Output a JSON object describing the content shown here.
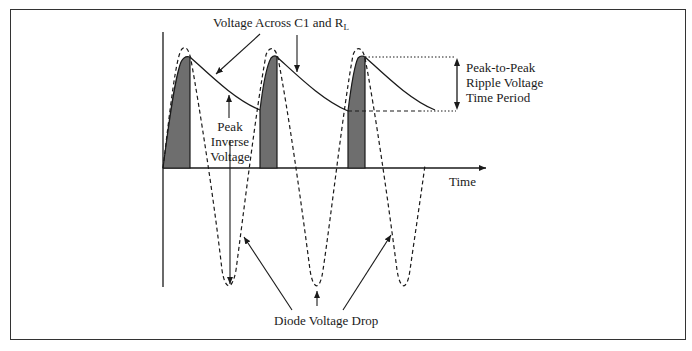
{
  "diagram": {
    "labels": {
      "voltage_across": "Voltage Across C1 and R",
      "voltage_across_sub": "L",
      "peak_inverse_line1": "Peak",
      "peak_inverse_line2": "Inverse",
      "peak_inverse_line3": "Voltage",
      "ripple_line1": "Peak-to-Peak",
      "ripple_line2": "Ripple Voltage",
      "ripple_line3": "Time Period",
      "time_axis": "Time",
      "diode_drop": "Diode Voltage Drop"
    },
    "colors": {
      "line": "#1a1a1a",
      "fill": "#6e6e6e",
      "frame": "#333333"
    },
    "series": [
      {
        "name": "input-sine",
        "style": "dashed"
      },
      {
        "name": "capacitor-voltage",
        "style": "solid"
      },
      {
        "name": "diode-conduction",
        "style": "filled"
      }
    ]
  }
}
